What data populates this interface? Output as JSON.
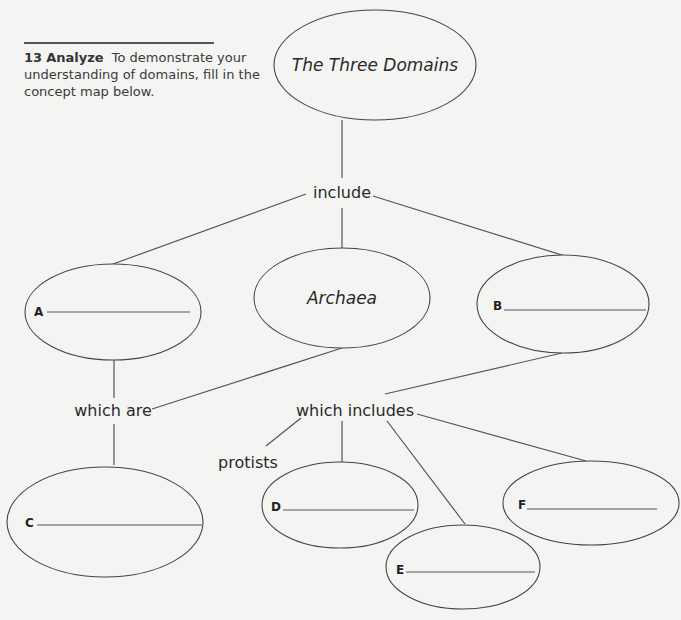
{
  "question": {
    "number": "13",
    "keyword": "Analyze",
    "text": "To demonstrate your understanding of domains, fill in the concept map below."
  },
  "concept_map": {
    "root": "The Three Domains",
    "link_root": "include",
    "archaea": "Archaea",
    "link_left": "which are",
    "link_right": "which includes",
    "protists": "protists",
    "blanks": [
      {
        "label": "A",
        "value": ""
      },
      {
        "label": "B",
        "value": ""
      },
      {
        "label": "C",
        "value": ""
      },
      {
        "label": "D",
        "value": ""
      },
      {
        "label": "E",
        "value": ""
      },
      {
        "label": "F",
        "value": ""
      }
    ]
  },
  "colors": {
    "background": "#f4f4f2",
    "ink": "#2a2a2a",
    "line": "#555555"
  }
}
